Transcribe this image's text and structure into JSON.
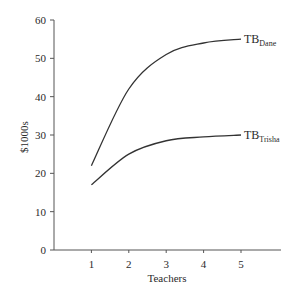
{
  "chart_data": {
    "type": "line",
    "title": "",
    "xlabel": "Teachers",
    "ylabel": "$1000s",
    "x": [
      1,
      2,
      3,
      4,
      5
    ],
    "x_ticks": [
      "1",
      "2",
      "3",
      "4",
      "5"
    ],
    "y_ticks": [
      "0",
      "10",
      "20",
      "30",
      "40",
      "50",
      "60"
    ],
    "ylim": [
      0,
      60
    ],
    "xlim": [
      0,
      6
    ],
    "grid": false,
    "legend": "inline labels at line ends",
    "series": [
      {
        "name": "TB_Dane",
        "label_main": "TB",
        "label_sub": "Dane",
        "values": [
          22,
          42,
          51,
          54,
          55
        ]
      },
      {
        "name": "TB_Trisha",
        "label_main": "TB",
        "label_sub": "Trisha",
        "values": [
          17,
          25,
          28.5,
          29.5,
          30
        ]
      }
    ]
  },
  "colors": {
    "line": "#333333",
    "axis": "#555555",
    "text": "#2a2a2a"
  }
}
